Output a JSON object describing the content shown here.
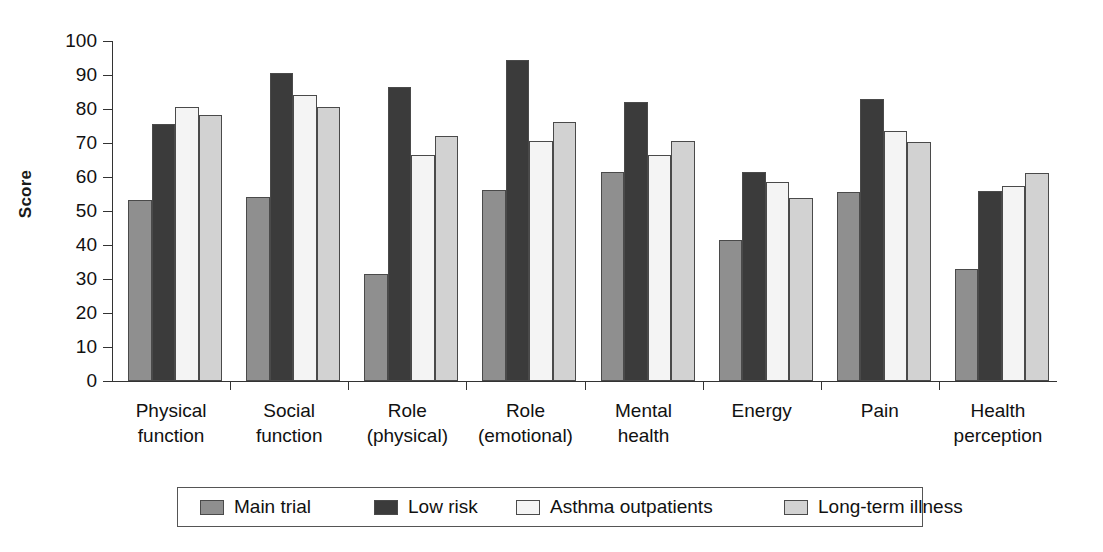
{
  "chart_data": {
    "type": "bar",
    "title": "",
    "xlabel": "",
    "ylabel": "Score",
    "ylim": [
      0,
      100
    ],
    "ytick_step": 10,
    "yticks": [
      100,
      90,
      80,
      70,
      60,
      50,
      40,
      30,
      20,
      10,
      0
    ],
    "grid": false,
    "legend_position": "bottom",
    "categories": [
      "Physical\nfunction",
      "Social\nfunction",
      "Role\n(physical)",
      "Role\n(emotional)",
      "Mental\nhealth",
      "Energy",
      "Pain",
      "Health\nperception"
    ],
    "category_lines": [
      [
        "Physical",
        "function"
      ],
      [
        "Social",
        "function"
      ],
      [
        "Role",
        "(physical)"
      ],
      [
        "Role",
        "(emotional)"
      ],
      [
        "Mental",
        "health"
      ],
      [
        "Energy",
        ""
      ],
      [
        "Pain",
        ""
      ],
      [
        "Health",
        "perception"
      ]
    ],
    "series": [
      {
        "name": "Main trial",
        "color": "#8f8f8f",
        "values": [
          53.3,
          54.2,
          31.5,
          56.3,
          61.5,
          41.5,
          55.5,
          33.0
        ]
      },
      {
        "name": "Low risk",
        "color": "#3b3b3b",
        "values": [
          75.7,
          90.7,
          86.5,
          94.5,
          82.2,
          61.5,
          83.0,
          56.0
        ]
      },
      {
        "name": "Asthma outpatients",
        "color": "#f4f4f4",
        "values": [
          80.7,
          84.0,
          66.6,
          70.6,
          66.5,
          58.5,
          73.6,
          57.5
        ]
      },
      {
        "name": "Long-term illness",
        "color": "#d2d2d2",
        "values": [
          78.3,
          80.6,
          72.2,
          76.3,
          70.5,
          53.8,
          70.3,
          61.2
        ]
      }
    ]
  },
  "legend": {
    "items": [
      {
        "label": "Main trial"
      },
      {
        "label": "Low risk"
      },
      {
        "label": "Asthma outpatients"
      },
      {
        "label": "Long-term illness"
      }
    ]
  },
  "axes": {
    "y_title": "Score"
  }
}
